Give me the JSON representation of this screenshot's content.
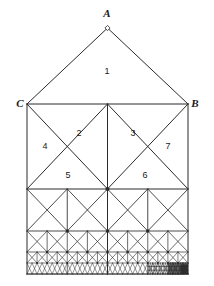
{
  "figure": {
    "background_color": "#ffffff",
    "stroke_color": "#2b2b2b",
    "apex_marker": {
      "name": "apex-vertex-marker",
      "shape": "diamond",
      "fill": "#ffffff",
      "stroke": "#2b2b2b"
    },
    "vertex_labels": [
      {
        "id": "A",
        "text": "A",
        "x": 107,
        "y": 13,
        "anchor": "middle"
      },
      {
        "id": "C",
        "text": "C",
        "x": 20,
        "y": 103,
        "anchor": "middle"
      },
      {
        "id": "B",
        "text": "B",
        "x": 195,
        "y": 103,
        "anchor": "middle"
      }
    ],
    "region_labels": [
      {
        "id": "1",
        "text": "1",
        "x": 107,
        "y": 71
      },
      {
        "id": "2",
        "text": "2",
        "x": 79,
        "y": 133
      },
      {
        "id": "3",
        "text": "3",
        "x": 133,
        "y": 133
      },
      {
        "id": "4",
        "text": "4",
        "x": 45,
        "y": 146
      },
      {
        "id": "5",
        "text": "5",
        "x": 68,
        "y": 175
      },
      {
        "id": "6",
        "text": "6",
        "x": 145,
        "y": 175
      },
      {
        "id": "7",
        "text": "7",
        "x": 168,
        "y": 146
      }
    ],
    "geometry": {
      "left_x": 27,
      "right_x": 188,
      "mid_x": 107.5,
      "apex_y": 28,
      "shoulder_y": 104,
      "tier1_y": 189,
      "tier2_y": 231,
      "tier3_y": 252,
      "tier4_y": 263,
      "bottom_y": 274
    }
  }
}
